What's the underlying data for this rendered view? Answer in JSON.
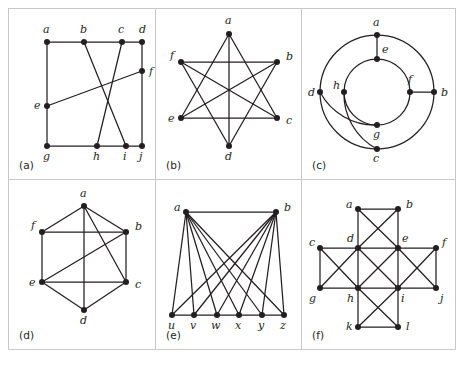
{
  "figure": {
    "panel_count": 6,
    "background_color": "#ffffff",
    "ink_color": "#231f20",
    "frame_color": "#c9c9c9"
  },
  "panels": [
    {
      "id": "a",
      "caption": "(a)",
      "layout": "grid-box",
      "vertices": [
        {
          "id": "a",
          "label": "a",
          "x": 38,
          "y": 33,
          "lx": 34,
          "ly": 24
        },
        {
          "id": "b",
          "label": "b",
          "x": 75,
          "y": 33,
          "lx": 71,
          "ly": 24
        },
        {
          "id": "c",
          "label": "c",
          "x": 113,
          "y": 33,
          "lx": 109,
          "ly": 24
        },
        {
          "id": "d",
          "label": "d",
          "x": 133,
          "y": 33,
          "lx": 130,
          "ly": 24
        },
        {
          "id": "e",
          "label": "e",
          "x": 38,
          "y": 97,
          "lx": 25,
          "ly": 100
        },
        {
          "id": "f",
          "label": "f",
          "x": 133,
          "y": 62,
          "lx": 140,
          "ly": 66
        },
        {
          "id": "g",
          "label": "g",
          "x": 38,
          "y": 137,
          "lx": 34,
          "ly": 151
        },
        {
          "id": "h",
          "label": "h",
          "x": 88,
          "y": 137,
          "lx": 84,
          "ly": 151
        },
        {
          "id": "i",
          "label": "i",
          "x": 117,
          "y": 137,
          "lx": 114,
          "ly": 151
        },
        {
          "id": "j",
          "label": "j",
          "x": 133,
          "y": 137,
          "lx": 130,
          "ly": 151
        }
      ],
      "edges": [
        [
          "a",
          "b"
        ],
        [
          "b",
          "c"
        ],
        [
          "c",
          "d"
        ],
        [
          "a",
          "e"
        ],
        [
          "e",
          "g"
        ],
        [
          "d",
          "f"
        ],
        [
          "f",
          "j"
        ],
        [
          "g",
          "h"
        ],
        [
          "h",
          "i"
        ],
        [
          "i",
          "j"
        ],
        [
          "b",
          "i"
        ],
        [
          "c",
          "h"
        ],
        [
          "e",
          "f"
        ]
      ],
      "curved_edges": []
    },
    {
      "id": "b",
      "caption": "(b)",
      "layout": "hexagram",
      "vertices": [
        {
          "id": "a",
          "label": "a",
          "x": 73,
          "y": 25,
          "lx": 69,
          "ly": 15
        },
        {
          "id": "b",
          "label": "b",
          "x": 121,
          "y": 53,
          "lx": 130,
          "ly": 51
        },
        {
          "id": "c",
          "label": "c",
          "x": 121,
          "y": 109,
          "lx": 130,
          "ly": 115
        },
        {
          "id": "d",
          "label": "d",
          "x": 73,
          "y": 137,
          "lx": 69,
          "ly": 151
        },
        {
          "id": "e",
          "label": "e",
          "x": 25,
          "y": 109,
          "lx": 12,
          "ly": 113
        },
        {
          "id": "f",
          "label": "f",
          "x": 25,
          "y": 53,
          "lx": 14,
          "ly": 50
        }
      ],
      "edges": [
        [
          "a",
          "c"
        ],
        [
          "a",
          "e"
        ],
        [
          "a",
          "d"
        ],
        [
          "b",
          "d"
        ],
        [
          "b",
          "f"
        ],
        [
          "b",
          "e"
        ],
        [
          "c",
          "e"
        ],
        [
          "c",
          "f"
        ],
        [
          "d",
          "f"
        ]
      ],
      "curved_edges": []
    },
    {
      "id": "c",
      "caption": "(c)",
      "layout": "concentric-circles",
      "outer_circle": {
        "cx": 75,
        "cy": 83,
        "r": 57
      },
      "inner_circle": {
        "cx": 75,
        "cy": 83,
        "r": 33
      },
      "vertices": [
        {
          "id": "a",
          "label": "a",
          "x": 75,
          "y": 26,
          "lx": 71,
          "ly": 17
        },
        {
          "id": "b",
          "label": "b",
          "x": 132,
          "y": 83,
          "lx": 139,
          "ly": 87
        },
        {
          "id": "c",
          "label": "c",
          "x": 75,
          "y": 140,
          "lx": 71,
          "ly": 153
        },
        {
          "id": "d",
          "label": "d",
          "x": 18,
          "y": 83,
          "lx": 6,
          "ly": 87
        },
        {
          "id": "e",
          "label": "e",
          "x": 75,
          "y": 50,
          "lx": 80,
          "ly": 44
        },
        {
          "id": "f",
          "label": "f",
          "x": 108,
          "y": 83,
          "lx": 106,
          "ly": 74
        },
        {
          "id": "g",
          "label": "g",
          "x": 75,
          "y": 116,
          "lx": 71,
          "ly": 129
        },
        {
          "id": "h",
          "label": "h",
          "x": 42,
          "y": 83,
          "lx": 31,
          "ly": 80
        }
      ],
      "edges": [
        [
          "a",
          "e"
        ],
        [
          "f",
          "b"
        ]
      ],
      "curved_edges": [
        {
          "from": "d",
          "to": "g",
          "sweep": 0,
          "radius": 62
        },
        {
          "from": "h",
          "to": "c",
          "sweep": 0,
          "radius": 62
        }
      ]
    },
    {
      "id": "d",
      "caption": "(d)",
      "layout": "hexagon-with-diagonals",
      "vertices": [
        {
          "id": "a",
          "label": "a",
          "x": 75,
          "y": 26,
          "lx": 71,
          "ly": 17
        },
        {
          "id": "b",
          "label": "b",
          "x": 117,
          "y": 52,
          "lx": 126,
          "ly": 50
        },
        {
          "id": "c",
          "label": "c",
          "x": 117,
          "y": 102,
          "lx": 126,
          "ly": 108
        },
        {
          "id": "d",
          "label": "d",
          "x": 75,
          "y": 130,
          "lx": 71,
          "ly": 144
        },
        {
          "id": "e",
          "label": "e",
          "x": 33,
          "y": 102,
          "lx": 20,
          "ly": 106
        },
        {
          "id": "f",
          "label": "f",
          "x": 33,
          "y": 52,
          "lx": 22,
          "ly": 49
        }
      ],
      "edges": [
        [
          "a",
          "b"
        ],
        [
          "b",
          "c"
        ],
        [
          "c",
          "d"
        ],
        [
          "d",
          "e"
        ],
        [
          "e",
          "f"
        ],
        [
          "f",
          "a"
        ],
        [
          "f",
          "b"
        ],
        [
          "e",
          "c"
        ],
        [
          "a",
          "d"
        ],
        [
          "a",
          "c"
        ],
        [
          "e",
          "b"
        ]
      ],
      "curved_edges": []
    },
    {
      "id": "e",
      "caption": "(e)",
      "layout": "bipartite-fan",
      "vertices": [
        {
          "id": "a",
          "label": "a",
          "x": 30,
          "y": 32,
          "lx": 18,
          "ly": 31
        },
        {
          "id": "b",
          "label": "b",
          "x": 120,
          "y": 32,
          "lx": 128,
          "ly": 31
        },
        {
          "id": "u",
          "label": "u",
          "x": 16,
          "y": 135,
          "lx": 12,
          "ly": 149
        },
        {
          "id": "v",
          "label": "v",
          "x": 38,
          "y": 135,
          "lx": 34,
          "ly": 149
        },
        {
          "id": "w",
          "label": "w",
          "x": 61,
          "y": 135,
          "lx": 55,
          "ly": 149
        },
        {
          "id": "x",
          "label": "x",
          "x": 83,
          "y": 135,
          "lx": 79,
          "ly": 149
        },
        {
          "id": "y",
          "label": "y",
          "x": 106,
          "y": 135,
          "lx": 102,
          "ly": 149
        },
        {
          "id": "z",
          "label": "z",
          "x": 128,
          "y": 135,
          "lx": 124,
          "ly": 149
        }
      ],
      "edges": [
        [
          "a",
          "b"
        ],
        [
          "a",
          "u"
        ],
        [
          "a",
          "v"
        ],
        [
          "a",
          "w"
        ],
        [
          "a",
          "x"
        ],
        [
          "a",
          "y"
        ],
        [
          "a",
          "z"
        ],
        [
          "b",
          "u"
        ],
        [
          "b",
          "v"
        ],
        [
          "b",
          "w"
        ],
        [
          "b",
          "x"
        ],
        [
          "b",
          "y"
        ],
        [
          "b",
          "z"
        ],
        [
          "u",
          "v"
        ],
        [
          "v",
          "w"
        ],
        [
          "w",
          "x"
        ],
        [
          "x",
          "y"
        ],
        [
          "y",
          "z"
        ]
      ],
      "curved_edges": []
    },
    {
      "id": "f",
      "caption": "(f)",
      "layout": "cross-grid",
      "vertices": [
        {
          "id": "a",
          "label": "a",
          "x": 56,
          "y": 29,
          "lx": 44,
          "ly": 28
        },
        {
          "id": "b",
          "label": "b",
          "x": 96,
          "y": 29,
          "lx": 104,
          "ly": 28
        },
        {
          "id": "c",
          "label": "c",
          "x": 18,
          "y": 68,
          "lx": 7,
          "ly": 66
        },
        {
          "id": "d",
          "label": "d",
          "x": 56,
          "y": 68,
          "lx": 45,
          "ly": 62
        },
        {
          "id": "e",
          "label": "e",
          "x": 96,
          "y": 68,
          "lx": 100,
          "ly": 62
        },
        {
          "id": "f",
          "label": "f",
          "x": 134,
          "y": 68,
          "lx": 140,
          "ly": 66
        },
        {
          "id": "g",
          "label": "g",
          "x": 18,
          "y": 108,
          "lx": 7,
          "ly": 122
        },
        {
          "id": "h",
          "label": "h",
          "x": 56,
          "y": 108,
          "lx": 45,
          "ly": 122
        },
        {
          "id": "i",
          "label": "i",
          "x": 96,
          "y": 108,
          "lx": 99,
          "ly": 122
        },
        {
          "id": "j",
          "label": "j",
          "x": 134,
          "y": 108,
          "lx": 138,
          "ly": 122
        },
        {
          "id": "k",
          "label": "k",
          "x": 56,
          "y": 147,
          "lx": 44,
          "ly": 150
        },
        {
          "id": "l",
          "label": "l",
          "x": 96,
          "y": 147,
          "lx": 104,
          "ly": 150
        }
      ],
      "edges": [
        [
          "a",
          "b"
        ],
        [
          "c",
          "d"
        ],
        [
          "d",
          "e"
        ],
        [
          "e",
          "f"
        ],
        [
          "g",
          "h"
        ],
        [
          "h",
          "i"
        ],
        [
          "i",
          "j"
        ],
        [
          "k",
          "l"
        ],
        [
          "a",
          "d"
        ],
        [
          "b",
          "e"
        ],
        [
          "c",
          "g"
        ],
        [
          "d",
          "h"
        ],
        [
          "e",
          "i"
        ],
        [
          "f",
          "j"
        ],
        [
          "h",
          "k"
        ],
        [
          "i",
          "l"
        ],
        [
          "a",
          "e"
        ],
        [
          "b",
          "d"
        ],
        [
          "c",
          "h"
        ],
        [
          "d",
          "g"
        ],
        [
          "d",
          "i"
        ],
        [
          "e",
          "h"
        ],
        [
          "e",
          "j"
        ],
        [
          "f",
          "i"
        ],
        [
          "h",
          "l"
        ],
        [
          "i",
          "k"
        ]
      ],
      "curved_edges": []
    }
  ]
}
